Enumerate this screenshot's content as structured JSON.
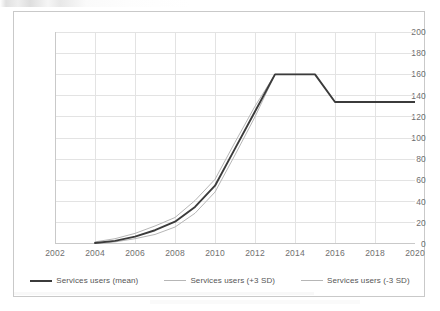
{
  "chart_data": {
    "type": "line",
    "title": "",
    "xlabel": "",
    "ylabel": "",
    "xlim": [
      2002,
      2020
    ],
    "ylim": [
      0,
      200
    ],
    "ytick_step": 20,
    "xtick_step": 2,
    "grid": true,
    "legend_position": "bottom",
    "y_ticks": [
      "0",
      "20",
      "40",
      "60",
      "80",
      "100",
      "120",
      "140",
      "160",
      "180",
      "200"
    ],
    "x_ticks": [
      "2002",
      "2004",
      "2006",
      "2008",
      "2010",
      "2012",
      "2014",
      "2016",
      "2018",
      "2020"
    ],
    "x": [
      2004,
      2005,
      2006,
      2007,
      2008,
      2009,
      2010,
      2011,
      2012,
      2013,
      2014,
      2015,
      2016,
      2017,
      2018,
      2019,
      2020
    ],
    "series": [
      {
        "name": "Services users (mean)",
        "color": "#3b3b3b",
        "width": 1.9,
        "values": [
          1,
          3,
          7,
          13,
          21,
          35,
          55,
          90,
          125,
          160,
          160,
          160,
          134,
          134,
          134,
          134,
          134
        ]
      },
      {
        "name": "Services users (+3 SD)",
        "color": "#b6b6b6",
        "width": 1.0,
        "values": [
          2,
          5,
          10,
          17,
          25,
          41,
          61,
          96,
          130,
          160,
          160,
          160,
          134,
          134,
          134,
          134,
          134
        ]
      },
      {
        "name": "Services users (-3 SD)",
        "color": "#b6b6b6",
        "width": 1.0,
        "values": [
          0,
          2,
          5,
          9,
          16,
          29,
          49,
          84,
          120,
          160,
          160,
          160,
          134,
          134,
          134,
          134,
          134
        ]
      }
    ]
  },
  "style": {
    "grid_color": "#e3e3e3",
    "axis_color": "#c9c9c9",
    "tick_text_color": "#6f6f6f",
    "legend_text_color": "#555555",
    "frame_border_color": "#c9c9c9",
    "background": "#ffffff"
  }
}
